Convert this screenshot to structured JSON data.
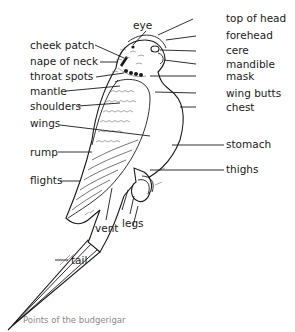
{
  "diagram": {
    "title": "Points of the budgerigar",
    "subject": "budgerigar",
    "labels_left": [
      {
        "id": "cheek-patch",
        "text": "cheek patch"
      },
      {
        "id": "nape-of-neck",
        "text": "nape of neck"
      },
      {
        "id": "throat-spots",
        "text": "throat spots"
      },
      {
        "id": "mantle",
        "text": "mantle"
      },
      {
        "id": "shoulders",
        "text": "shoulders"
      },
      {
        "id": "wings",
        "text": "wings"
      },
      {
        "id": "rump",
        "text": "rump"
      },
      {
        "id": "flights",
        "text": "flights"
      }
    ],
    "labels_right": [
      {
        "id": "top-of-head",
        "text": "top of head"
      },
      {
        "id": "forehead",
        "text": "forehead"
      },
      {
        "id": "cere",
        "text": "cere"
      },
      {
        "id": "mandible",
        "text": "mandible"
      },
      {
        "id": "mask",
        "text": "mask"
      },
      {
        "id": "wing-butts",
        "text": "wing butts"
      },
      {
        "id": "chest",
        "text": "chest"
      },
      {
        "id": "stomach",
        "text": "stomach"
      },
      {
        "id": "thighs",
        "text": "thighs"
      }
    ],
    "labels_other": [
      {
        "id": "eye",
        "text": "eye"
      },
      {
        "id": "vent",
        "text": "vent"
      },
      {
        "id": "legs",
        "text": "legs"
      },
      {
        "id": "tail",
        "text": "tail"
      }
    ],
    "colors": {
      "line": "#1a1a1a",
      "caption": "#8a8a8a",
      "background": "#ffffff"
    }
  }
}
